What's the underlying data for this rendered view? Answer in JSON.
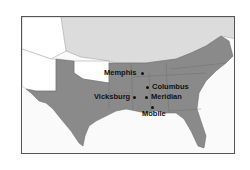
{
  "map": {
    "title": "",
    "colors": {
      "confederacy": "#8a8a8a",
      "union": "#dcdcdc",
      "territory": "#ffffff",
      "water": "#fafafa",
      "border": "#555555",
      "text": "#111111"
    },
    "cities": [
      {
        "name": "Memphis",
        "x": 141,
        "y": 72
      },
      {
        "name": "Columbus",
        "x": 146,
        "y": 86
      },
      {
        "name": "Vicksburg",
        "x": 133,
        "y": 96
      },
      {
        "name": "Meridian",
        "x": 145,
        "y": 96
      },
      {
        "name": "Mobile",
        "x": 151,
        "y": 106
      }
    ]
  }
}
